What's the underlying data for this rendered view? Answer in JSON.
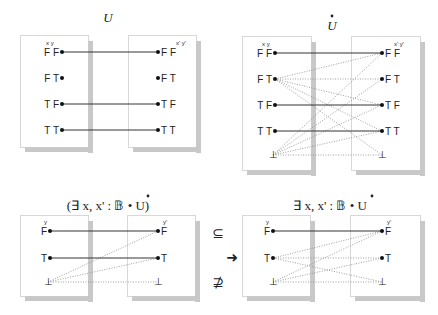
{
  "colors": {
    "box_border": "#b0b0b0",
    "shadow": "#c8c8c8",
    "solid_line": "#333333",
    "dotted_line": "#888888",
    "text": "#222222"
  },
  "diagrams": [
    {
      "id": "U",
      "title": "U",
      "title_dot": false,
      "title_pos": [
        108,
        22
      ],
      "left_box": [
        20,
        35,
        68,
        112
      ],
      "right_box": [
        128,
        35,
        68,
        112
      ],
      "header_left": "x y",
      "header_right": "x' y'",
      "header_pos": [
        [
          46,
          45
        ],
        [
          176,
          45
        ]
      ],
      "left_nodes": [
        {
          "label": "F F",
          "x": 62,
          "y": 52
        },
        {
          "label": "F T",
          "x": 62,
          "y": 78
        },
        {
          "label": "T F",
          "x": 62,
          "y": 104
        },
        {
          "label": "T T",
          "x": 62,
          "y": 130
        }
      ],
      "right_nodes": [
        {
          "label": "F F",
          "x": 158,
          "y": 52
        },
        {
          "label": "F T",
          "x": 158,
          "y": 78
        },
        {
          "label": "T F",
          "x": 158,
          "y": 104
        },
        {
          "label": "T T",
          "x": 158,
          "y": 130
        }
      ],
      "solid_edges": [
        [
          0,
          0
        ],
        [
          2,
          2
        ],
        [
          3,
          3
        ]
      ],
      "dotted_edges": []
    },
    {
      "id": "U-dot",
      "title": "U",
      "title_dot": true,
      "title_pos": [
        332,
        30
      ],
      "left_box": [
        242,
        36,
        69,
        134
      ],
      "right_box": [
        351,
        36,
        69,
        134
      ],
      "header_left": "x y",
      "header_right": "x' y'",
      "header_pos": [
        [
          262,
          46
        ],
        [
          394,
          46
        ]
      ],
      "left_nodes": [
        {
          "label": "F F",
          "x": 275,
          "y": 53
        },
        {
          "label": "F T",
          "x": 275,
          "y": 79
        },
        {
          "label": "T F",
          "x": 275,
          "y": 105
        },
        {
          "label": "T T",
          "x": 275,
          "y": 131
        },
        {
          "label": "⊥",
          "x": 273,
          "y": 155,
          "bottom": true
        }
      ],
      "right_nodes": [
        {
          "label": "F F",
          "x": 382,
          "y": 53
        },
        {
          "label": "F T",
          "x": 382,
          "y": 79
        },
        {
          "label": "T F",
          "x": 382,
          "y": 105
        },
        {
          "label": "T T",
          "x": 382,
          "y": 131
        },
        {
          "label": "⊥",
          "x": 382,
          "y": 155,
          "bottom": true
        }
      ],
      "solid_edges": [
        [
          0,
          0
        ],
        [
          2,
          2
        ],
        [
          3,
          3
        ]
      ],
      "dotted_edges": [
        [
          1,
          0
        ],
        [
          1,
          1
        ],
        [
          1,
          2
        ],
        [
          1,
          3
        ],
        [
          1,
          4
        ],
        [
          4,
          0
        ],
        [
          4,
          1
        ],
        [
          4,
          2
        ],
        [
          4,
          3
        ],
        [
          4,
          4
        ]
      ]
    },
    {
      "id": "exists-U-dot",
      "title": "(∃ x, x' : 𝔹 • U)",
      "title_dot": true,
      "title_pos": [
        108,
        210
      ],
      "left_box": [
        20,
        215,
        68,
        81
      ],
      "right_box": [
        127,
        215,
        68,
        81
      ],
      "header_left": "y",
      "header_right": "y'",
      "header_pos": [
        [
          44,
          224
        ],
        [
          163,
          224
        ]
      ],
      "left_nodes": [
        {
          "label": "F",
          "x": 50,
          "y": 231
        },
        {
          "label": "T",
          "x": 50,
          "y": 258
        },
        {
          "label": "⊥",
          "x": 48,
          "y": 282,
          "bottom": true
        }
      ],
      "right_nodes": [
        {
          "label": "F",
          "x": 158,
          "y": 231
        },
        {
          "label": "T",
          "x": 158,
          "y": 258
        },
        {
          "label": "⊥",
          "x": 158,
          "y": 282,
          "bottom": true
        }
      ],
      "solid_edges": [
        [
          0,
          0
        ],
        [
          1,
          1
        ]
      ],
      "dotted_edges": [
        [
          2,
          0
        ],
        [
          2,
          1
        ],
        [
          2,
          2
        ]
      ]
    },
    {
      "id": "exists-U-dot-2",
      "title": "∃ x, x' : 𝔹 • U",
      "title_dot": true,
      "title_pos": [
        330,
        210
      ],
      "left_box": [
        242,
        215,
        68,
        81
      ],
      "right_box": [
        350,
        215,
        70,
        81
      ],
      "header_left": "y",
      "header_right": "y'",
      "header_pos": [
        [
          266,
          224
        ],
        [
          387,
          224
        ]
      ],
      "left_nodes": [
        {
          "label": "F",
          "x": 273,
          "y": 231
        },
        {
          "label": "T",
          "x": 273,
          "y": 258
        },
        {
          "label": "⊥",
          "x": 273,
          "y": 282,
          "bottom": true
        }
      ],
      "right_nodes": [
        {
          "label": "F",
          "x": 382,
          "y": 231
        },
        {
          "label": "T",
          "x": 382,
          "y": 258
        },
        {
          "label": "⊥",
          "x": 382,
          "y": 282,
          "bottom": true
        }
      ],
      "solid_edges": [
        [
          0,
          0
        ]
      ],
      "dotted_edges": [
        [
          1,
          0
        ],
        [
          1,
          1
        ],
        [
          1,
          2
        ],
        [
          2,
          0
        ],
        [
          2,
          1
        ],
        [
          2,
          2
        ]
      ]
    }
  ],
  "relations": [
    {
      "symbol": "⊆",
      "x": 218,
      "y": 238,
      "name": "subset-symbol"
    },
    {
      "symbol": "⊉",
      "x": 218,
      "y": 287,
      "name": "not-superset-symbol"
    }
  ],
  "arrow": {
    "symbol": "➜",
    "x": 232,
    "y": 262
  }
}
